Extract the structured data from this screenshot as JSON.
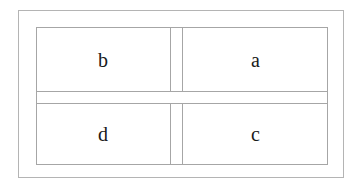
{
  "figure": {
    "title": "",
    "type": "two-by-two-partition-diagram",
    "stroke_color": "#a6a6a6",
    "outer_stroke_color": "#b4b4b4",
    "background_color": "#ffffff",
    "text_color": "#1a1a1a"
  },
  "cells": {
    "top_left": "b",
    "top_right": "a",
    "bottom_left": "d",
    "bottom_right": "c"
  }
}
